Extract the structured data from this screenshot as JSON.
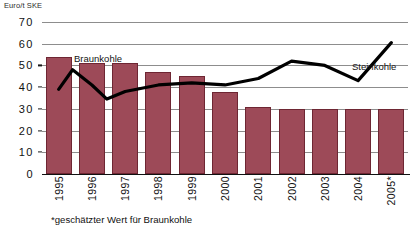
{
  "chart_data": {
    "type": "bar",
    "title": "",
    "subtitle": "",
    "ylabel": "Euro/t SKE",
    "xlabel": "",
    "ylim": [
      0,
      70
    ],
    "yticks": [
      0,
      10,
      20,
      30,
      40,
      50,
      60,
      70
    ],
    "grid": true,
    "legend_position": "inline-annotations",
    "categories": [
      "1995",
      "1996",
      "1997",
      "1998",
      "1999",
      "2000",
      "2001",
      "2002",
      "2003",
      "2004",
      "2005*"
    ],
    "series": [
      {
        "name": "Braunkohle",
        "type": "bar",
        "color": "#9d4a58",
        "values": [
          54,
          51,
          51,
          47,
          45,
          38,
          31,
          30,
          30,
          30,
          30
        ]
      },
      {
        "name": "Steinkohle",
        "type": "line",
        "color": "#000000",
        "values": [
          39,
          41,
          38,
          41,
          42,
          41,
          44,
          52,
          50,
          43,
          60.5
        ]
      }
    ],
    "annotations": [
      {
        "text": "Braunkohle",
        "series": "Braunkohle"
      },
      {
        "text": "Steinkohle",
        "series": "Steinkohle"
      }
    ],
    "footnote": "*geschätzter Wert für Braunkohle"
  },
  "axis": {
    "unit_label": "Euro/t SKE",
    "ytick_labels": [
      "70",
      "60",
      "50",
      "40",
      "30",
      "20",
      "10",
      "0"
    ],
    "xtick_labels": [
      "1995",
      "1996",
      "1997",
      "1998",
      "1999",
      "2000",
      "2001",
      "2002",
      "2003",
      "2004",
      "2005*"
    ]
  },
  "labels": {
    "braunkohle": "Braunkohle",
    "steinkohle": "Steinkohle",
    "footnote": "*geschätzter Wert für Braunkohle"
  }
}
